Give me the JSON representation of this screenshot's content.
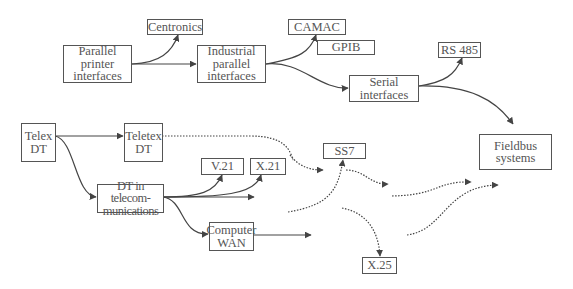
{
  "diagram": {
    "colors": {
      "line": "#444444",
      "box_border": "#555555",
      "text": "#555555",
      "background": "#ffffff"
    },
    "nodes": {
      "centronics": "Centronics",
      "parallel_printer": "Parallel\nprinter\ninterfaces",
      "industrial_parallel": "Industrial\nparallel\ninterfaces",
      "camac": "CAMAC",
      "gpib": "GPIB",
      "rs485": "RS 485",
      "serial": "Serial\ninterfaces",
      "telex": "Telex\nDT",
      "teletex": "Teletex\nDT",
      "fieldbus": "Fieldbus\nsystems",
      "ss7": "SS7",
      "v21": "V.21",
      "x21": "X.21",
      "dt_telecom": "DT in telecom-\nmunications",
      "computer_wan": "Computer\nWAN",
      "x25": "X.25"
    },
    "edges": [
      {
        "from": "parallel_printer",
        "to": "centronics",
        "style": "solid"
      },
      {
        "from": "parallel_printer",
        "to": "industrial_parallel",
        "style": "solid"
      },
      {
        "from": "industrial_parallel",
        "to": "camac",
        "style": "solid"
      },
      {
        "from": "industrial_parallel",
        "to": "serial",
        "style": "solid"
      },
      {
        "from": "serial",
        "to": "rs485",
        "style": "solid"
      },
      {
        "from": "serial",
        "to": "fieldbus",
        "style": "solid"
      },
      {
        "from": "telex",
        "to": "teletex",
        "style": "solid"
      },
      {
        "from": "telex",
        "to": "dt_telecom",
        "style": "solid"
      },
      {
        "from": "dt_telecom",
        "to": "v21",
        "style": "solid"
      },
      {
        "from": "dt_telecom",
        "to": "x21",
        "style": "solid"
      },
      {
        "from": "dt_telecom",
        "to": "(open)",
        "style": "solid"
      },
      {
        "from": "dt_telecom",
        "to": "computer_wan",
        "style": "solid"
      },
      {
        "from": "computer_wan",
        "to": "(open)",
        "style": "solid"
      },
      {
        "from": "teletex",
        "to": "(towards ss7)",
        "style": "dotted"
      },
      {
        "from": "(open)",
        "to": "ss7",
        "style": "dotted"
      },
      {
        "from": "ss7",
        "to": "(open)",
        "style": "dotted"
      },
      {
        "from": "(open)",
        "to": "x25",
        "style": "dotted"
      },
      {
        "from": "(open)",
        "to": "(towards fieldbus)",
        "style": "dotted"
      },
      {
        "from": "(open)",
        "to": "(towards fieldbus)",
        "style": "dotted"
      }
    ]
  }
}
